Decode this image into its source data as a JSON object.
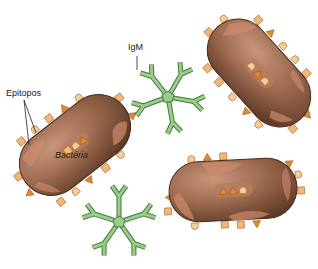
{
  "labels": {
    "igm": "IgM",
    "epitopes": "Epitopos",
    "bacteria": "Bactéria"
  },
  "colors": {
    "bacteria_body": "#9c6a4e",
    "bacteria_dark": "#5e3a26",
    "bacteria_patch": "#d08a6e",
    "epitope_fill": "#f0b878",
    "epitope_stroke": "#b0703a",
    "triangle_fill": "#e08a30",
    "antibody_fill": "#9ccc8a",
    "antibody_stroke": "#3f7a3a"
  },
  "elements": {
    "bacteria_count": 3,
    "igm_count": 2
  }
}
